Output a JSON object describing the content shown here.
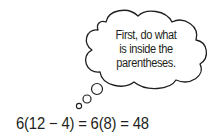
{
  "thought_bubble": {
    "lines": [
      "First, do what",
      "is inside the",
      "parentheses."
    ]
  },
  "equation": {
    "text": "6(12 − 4) = 6(8) = 48"
  },
  "colors": {
    "ink": "#231f20",
    "background": "#ffffff"
  }
}
